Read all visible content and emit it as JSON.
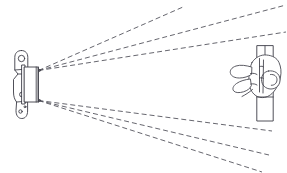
{
  "figure": {
    "background_color": "#ffffff",
    "line_color": "#3c3c46",
    "beam_color": "#55555e",
    "width": 287,
    "height": 173
  },
  "sensor": {
    "label": "wall-mounted sensor head",
    "mounting_bracket": {
      "label": "mounting bracket plate",
      "hole_count": 3,
      "top_hole": {
        "cx": 21.5,
        "cy": 58.5,
        "r": 3.2
      },
      "middle_hole": {
        "cx": 22.0,
        "cy": 94.5,
        "r": 2.4
      },
      "small_holes": [
        {
          "cx": 25.5,
          "cy": 101.5,
          "r": 0.9
        },
        {
          "cx": 25.0,
          "cy": 107.0,
          "r": 0.9
        },
        {
          "cx": 20.5,
          "cy": 111.5,
          "r": 1.6
        }
      ]
    },
    "emitter_body": {
      "label": "emitter housing",
      "x": 24.5,
      "y": 67.0,
      "width": 13.5,
      "height": 35.0
    },
    "collar": {
      "label": "collar flange",
      "x": 22.0,
      "y": 65.0,
      "width": 3.0,
      "height": 39.0
    },
    "emission_origins": {
      "upper_vertex": {
        "x": 38.5,
        "y": 70.5
      },
      "lower_vertex": {
        "x": 38.5,
        "y": 100.5
      }
    }
  },
  "beams": {
    "label": "dashed detection beams",
    "count": 6,
    "dash_pattern": "5 3",
    "upper_group": [
      {
        "name": "beam-upper-1",
        "x1": 38.5,
        "y1": 70.5,
        "x2": 183.0,
        "y2": 7.0
      },
      {
        "name": "beam-upper-2",
        "x1": 38.5,
        "y1": 70.5,
        "x2": 286.0,
        "y2": 5.0
      },
      {
        "name": "beam-upper-3",
        "x1": 38.5,
        "y1": 70.5,
        "x2": 286.0,
        "y2": 32.0
      }
    ],
    "lower_group": [
      {
        "name": "beam-lower-1",
        "x1": 38.5,
        "y1": 100.5,
        "x2": 272.0,
        "y2": 131.0
      },
      {
        "name": "beam-lower-2",
        "x1": 38.5,
        "y1": 100.5,
        "x2": 269.0,
        "y2": 155.0
      },
      {
        "name": "beam-lower-3",
        "x1": 38.5,
        "y1": 100.5,
        "x2": 262.0,
        "y2": 172.0
      }
    ]
  },
  "target": {
    "label": "hand gripping vertical pole",
    "pole": {
      "label": "vertical pole",
      "x_left": 256.5,
      "x_right": 273.5,
      "y_top": 46.0,
      "y_bottom": 121.0
    },
    "hand": {
      "label": "human hand",
      "orientation": "gripping",
      "finger_count": 4
    }
  }
}
